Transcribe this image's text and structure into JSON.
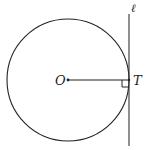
{
  "diagram": {
    "type": "geometry",
    "labels": {
      "center": "O",
      "tangent_point": "T",
      "tangent_line": "ℓ"
    },
    "circle": {
      "cx": 68,
      "cy": 80,
      "r": 61
    },
    "tangent_line": {
      "x": 129,
      "y1": 14,
      "y2": 146
    },
    "right_angle_marker": true,
    "stroke_color": "#222222"
  }
}
